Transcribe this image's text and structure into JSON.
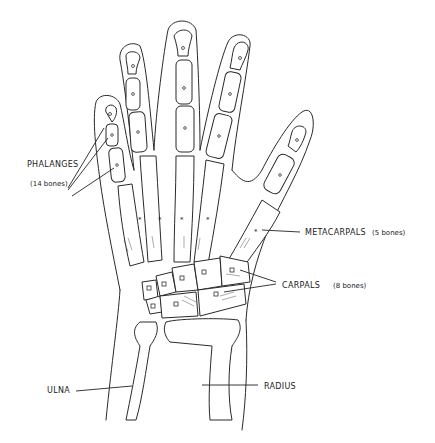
{
  "diagram": {
    "labels": {
      "phalanges": "PHALANGES",
      "phalanges_count": "(14 bones)",
      "metacarpals": "METACARPALS",
      "metacarpals_count": "(5 bones)",
      "carpals": "CARPALS",
      "carpals_count": "(8 bones)",
      "ulna": "ULNA",
      "radius": "RADIUS"
    },
    "colors": {
      "ink": "#2a2a2a",
      "background": "#ffffff"
    }
  }
}
